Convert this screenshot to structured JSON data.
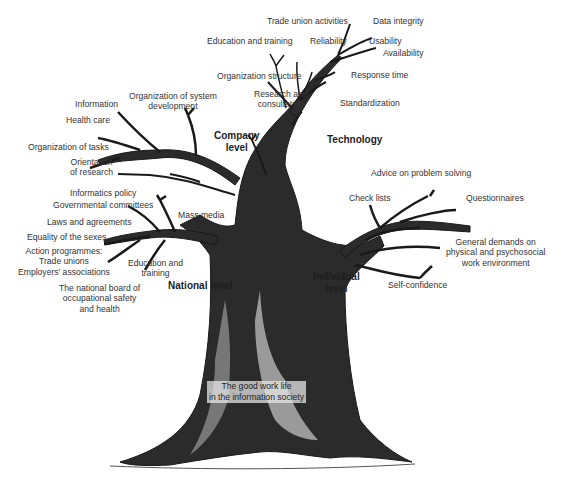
{
  "title": "The good work life in the information society",
  "trunk_label": [
    "The good work life",
    "in the information society"
  ],
  "colors": {
    "background": "#ffffff",
    "ink": "#1e1e1e",
    "text": "#333333"
  },
  "branches": {
    "technology": {
      "label": "Technology",
      "items": [
        "Trade union activities",
        "Data integrity",
        "Education and training",
        "Reliability",
        "Usability",
        "Availability",
        "Organization structure",
        "Response time",
        "Research and consultation",
        "Standardization"
      ]
    },
    "company": {
      "label": [
        "Company",
        "level"
      ],
      "items": [
        "Information",
        "Organization of system development",
        "Health care",
        "Organization of tasks",
        "Orientation of research"
      ]
    },
    "national": {
      "label": "National level",
      "items": [
        "Informatics policy",
        "Governmental committees",
        "Mass media",
        "Laws and agreements",
        "Equality of the sexes",
        "Action programmes:",
        "Trade unions",
        "Employers' associations",
        "Education and training",
        "The national board of occupational safety and health"
      ]
    },
    "individual": {
      "label": [
        "Individual",
        "level"
      ],
      "items": [
        "Advice on problem solving",
        "Check lists",
        "Questionnaires",
        "General demands on physical and psychosocial work environment",
        "Self-confidence"
      ]
    }
  },
  "labels": {
    "trade_union": "Trade union activities",
    "data_integrity": "Data integrity",
    "edu_training_top": "Education and training",
    "reliability": "Reliability",
    "usability": "Usability",
    "availability": "Availability",
    "org_structure": "Organization structure",
    "response_time": "Response time",
    "research_1": "Research and",
    "research_2": "consultation",
    "standardization": "Standardization",
    "technology": "Technology",
    "information": "Information",
    "org_sys_1": "Organization of system",
    "org_sys_2": "development",
    "health_care": "Health care",
    "company_1": "Company",
    "company_2": "level",
    "org_tasks": "Organization of tasks",
    "orient_1": "Orientation",
    "orient_2": "of research",
    "informatics": "Informatics policy",
    "gov_comm": "Governmental committees",
    "mass_media": "Mass media",
    "laws": "Laws and agreements",
    "equality": "Equality of the sexes",
    "action_1": "Action programmes:",
    "action_2": "Trade unions",
    "action_3": "Employers' associations",
    "edu_nat_1": "Education and",
    "edu_nat_2": "training",
    "national": "National level",
    "board_1": "The national board of",
    "board_2": "occupational safety",
    "board_3": "and health",
    "advice": "Advice on problem solving",
    "check_lists": "Check lists",
    "questionnaires": "Questionnaires",
    "general_1": "General demands on",
    "general_2": "physical and psychosocial",
    "general_3": "work environment",
    "individual_1": "Individual",
    "individual_2": "level",
    "self_conf": "Self-confidence",
    "root_1": "The good work life",
    "root_2": "in the information society"
  }
}
